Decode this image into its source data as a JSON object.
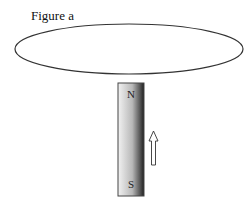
{
  "figure": {
    "title": "Figure a",
    "loop": {
      "shape": "ellipse",
      "cx": 129,
      "cy": 49,
      "rx": 114,
      "ry": 25,
      "stroke": "#333333"
    },
    "magnet": {
      "north_label": "N",
      "south_label": "S",
      "x": 118,
      "y": 83,
      "width": 26,
      "height": 113,
      "gradient": [
        "#f2f2f2",
        "#b0b0b0",
        "#2a2a2a"
      ]
    },
    "arrow": {
      "direction": "up",
      "meaning": "magnet motion toward loop"
    }
  }
}
